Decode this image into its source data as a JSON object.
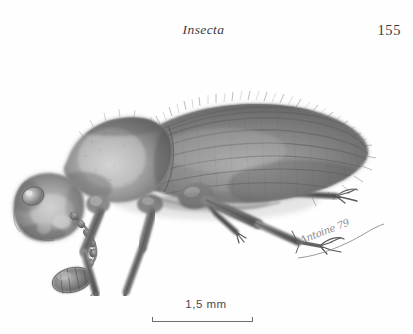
{
  "page": {
    "running_head": "Insecta",
    "page_number": "155",
    "background_color": "#fefefe",
    "ink_color": "#3a3a3c"
  },
  "figure": {
    "name": "beetle-lateral-view",
    "medium": "graphite pencil drawing",
    "orientation": "lateral, facing left",
    "parts": [
      "elytra",
      "pronotum",
      "head",
      "compound-eye",
      "antenna",
      "foreleg",
      "midleg",
      "hindleg",
      "tarsal-claws",
      "setae-fringe"
    ],
    "tone_light": "#d9d9d9",
    "tone_mid": "#9a9a9a",
    "tone_dark": "#5e5e5e",
    "tone_shadow": "#3f3f3f"
  },
  "signature": {
    "text": "Antoine 79",
    "year": "79",
    "color": "#8c8c90"
  },
  "scale_bar": {
    "value": "1,5",
    "unit": "mm",
    "label": "1,5  mm",
    "line_color": "#6d6d70",
    "length_px": "101"
  }
}
